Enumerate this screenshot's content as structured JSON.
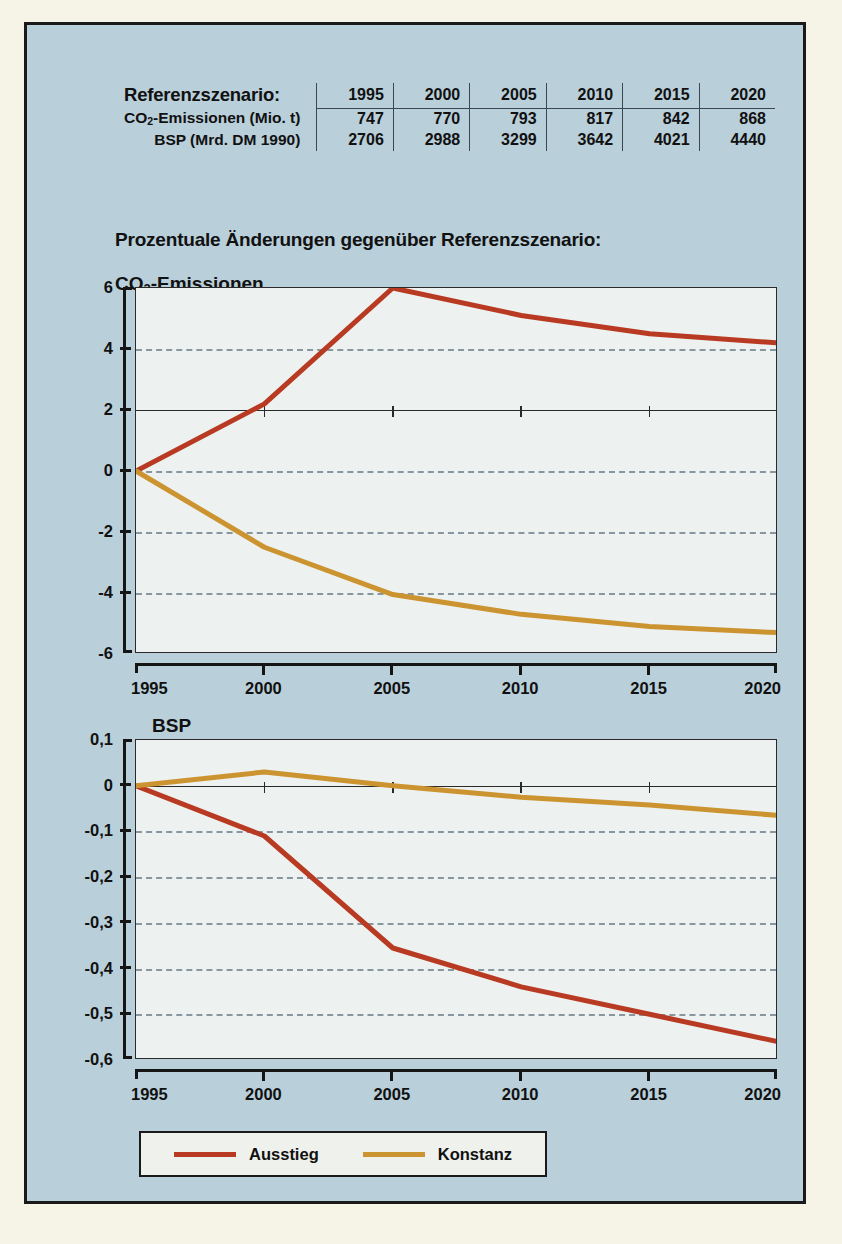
{
  "panel": {
    "background_color": "#B9CFDA",
    "border_color": "#1A1A1A",
    "page_background": "#F6F3E7"
  },
  "reference_table": {
    "title": "Referenszenario:",
    "title_display": "Referenzszenario:",
    "years": [
      "1995",
      "2000",
      "2005",
      "2010",
      "2015",
      "2020"
    ],
    "rows": [
      {
        "label_html": "CO<sub>2</sub>-Emissionen (Mio. t)",
        "label": "CO2-Emissionen (Mio. t)",
        "values": [
          "747",
          "770",
          "793",
          "817",
          "842",
          "868"
        ]
      },
      {
        "label_html": "BSP (Mrd. DM 1990)",
        "label": "BSP (Mrd. DM 1990)",
        "values": [
          "2706",
          "2988",
          "3299",
          "3642",
          "4021",
          "4440"
        ]
      }
    ]
  },
  "headings": {
    "main": "Prozentuale Änderungen gegenüber Referenzszenario:",
    "chart1": "CO2-Emissionen",
    "chart2": "BSP"
  },
  "legend": {
    "position": "bottom-left",
    "items": [
      {
        "label": "Ausstieg",
        "color": "#B93A22"
      },
      {
        "label": "Konstanz",
        "color": "#CC9430"
      }
    ]
  },
  "colors": {
    "ausstieg": "#B93A22",
    "konstanz": "#CC9430",
    "plot_background": "#EDF1F0",
    "gridline": "#8896A0",
    "axis": "#151515",
    "text": "#111111"
  },
  "chart_data": [
    {
      "type": "line",
      "title": "CO2-Emissionen",
      "subtitle": "Prozentuale Änderungen gegenüber Referenzszenario",
      "xlabel": "",
      "ylabel": "",
      "x": [
        1995,
        2000,
        2005,
        2010,
        2015,
        2020
      ],
      "xticklabels": [
        "1995",
        "2000",
        "2005",
        "2010",
        "2015",
        "2020"
      ],
      "xlim": [
        1995,
        2020
      ],
      "ylim": [
        -6,
        6
      ],
      "yticks": [
        6,
        4,
        2,
        0,
        -2,
        -4,
        -6
      ],
      "yticklabels": [
        "6",
        "4",
        "2",
        "0",
        "-2",
        "-4",
        "-6"
      ],
      "grid": "horizontal-dashed",
      "zero_axis_at": 2,
      "legend_position": "below-figure",
      "series": [
        {
          "name": "Ausstieg",
          "color": "#B93A22",
          "values": [
            0,
            2.2,
            6.0,
            5.1,
            4.5,
            4.2
          ]
        },
        {
          "name": "Konstanz",
          "color": "#CC9430",
          "values": [
            0,
            -2.5,
            -4.05,
            -4.7,
            -5.1,
            -5.3
          ]
        }
      ]
    },
    {
      "type": "line",
      "title": "BSP",
      "subtitle": "Prozentuale Änderungen gegenüber Referenzszenario",
      "xlabel": "",
      "ylabel": "",
      "x": [
        1995,
        2000,
        2005,
        2010,
        2015,
        2020
      ],
      "xticklabels": [
        "1995",
        "2000",
        "2005",
        "2010",
        "2015",
        "2020"
      ],
      "xlim": [
        1995,
        2020
      ],
      "ylim": [
        -0.6,
        0.1
      ],
      "yticks": [
        0.1,
        0,
        -0.1,
        -0.2,
        -0.3,
        -0.4,
        -0.5,
        -0.6
      ],
      "yticklabels": [
        "0,1",
        "0",
        "-0,1",
        "-0,2",
        "-0,3",
        "-0,4",
        "-0,5",
        "-0,6"
      ],
      "grid": "horizontal-dashed",
      "zero_axis_at": 0,
      "legend_position": "below-figure",
      "series": [
        {
          "name": "Ausstieg",
          "color": "#B93A22",
          "values": [
            0,
            -0.11,
            -0.355,
            -0.44,
            -0.5,
            -0.56
          ]
        },
        {
          "name": "Konstanz",
          "color": "#CC9430",
          "values": [
            0,
            0.03,
            0.0,
            -0.025,
            -0.042,
            -0.065
          ]
        }
      ]
    }
  ]
}
